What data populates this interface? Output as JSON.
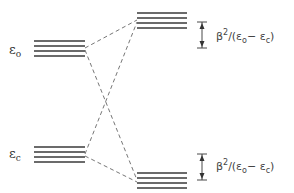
{
  "diagram": {
    "type": "energy-level-diagram",
    "levels": {
      "left_upper": {
        "label": "ε",
        "subscript": "o",
        "lines": 4
      },
      "left_lower": {
        "label": "ε",
        "subscript": "c",
        "lines": 4
      },
      "right_upper": {
        "lines": 4
      },
      "right_lower": {
        "lines": 4
      }
    },
    "shift_labels": {
      "upper": {
        "beta": "β",
        "sup": "2",
        "rest": "/(ε",
        "sub1": "o",
        "minus": "− ε",
        "sub2": "c",
        "close": ")"
      },
      "lower": {
        "beta": "β",
        "sup": "2",
        "rest": "/(ε",
        "sub1": "o",
        "minus": "− ε",
        "sub2": "c",
        "close": ")"
      }
    },
    "connections": [
      {
        "from": "left_upper",
        "to": "right_upper",
        "style": "dashed"
      },
      {
        "from": "left_upper",
        "to": "right_lower",
        "style": "dashed"
      },
      {
        "from": "left_lower",
        "to": "right_upper",
        "style": "dashed"
      },
      {
        "from": "left_lower",
        "to": "right_lower",
        "style": "dashed"
      }
    ]
  }
}
